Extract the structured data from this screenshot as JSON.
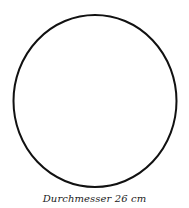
{
  "diagram": {
    "shape": "circle",
    "stroke_color": "#111111",
    "caption": "Durchmesser 26 cm"
  }
}
